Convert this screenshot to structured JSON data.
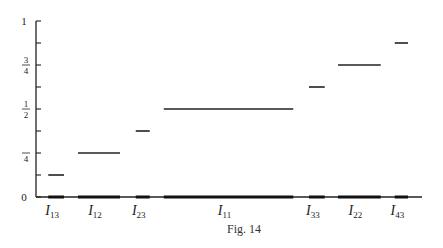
{
  "chart_data": {
    "type": "step-segments",
    "title": "",
    "caption": "Fig. 14",
    "xlabel": "",
    "ylabel": "",
    "ylim": [
      0,
      1
    ],
    "grid": false,
    "y_ticks": [
      0,
      0.125,
      0.25,
      0.375,
      0.5,
      0.625,
      0.75,
      0.875,
      1
    ],
    "y_tick_labels": [
      {
        "value": 0,
        "label": "0"
      },
      {
        "value": 0.25,
        "num": "",
        "den": "4"
      },
      {
        "value": 0.5,
        "num": "1",
        "den": "2"
      },
      {
        "value": 0.75,
        "num": "3",
        "den": "4"
      },
      {
        "value": 1,
        "label": "1"
      }
    ],
    "segments": [
      {
        "name": "I13",
        "symbol": "I",
        "sub": "13",
        "value": 0.125,
        "x_start": 0.035,
        "x_end": 0.08
      },
      {
        "name": "I12",
        "symbol": "I",
        "sub": "12",
        "value": 0.25,
        "x_start": 0.12,
        "x_end": 0.24
      },
      {
        "name": "I23",
        "symbol": "I",
        "sub": "23",
        "value": 0.375,
        "x_start": 0.285,
        "x_end": 0.325
      },
      {
        "name": "I11",
        "symbol": "I",
        "sub": "11",
        "value": 0.5,
        "x_start": 0.365,
        "x_end": 0.735
      },
      {
        "name": "I33",
        "symbol": "I",
        "sub": "33",
        "value": 0.625,
        "x_start": 0.78,
        "x_end": 0.825
      },
      {
        "name": "I22",
        "symbol": "I",
        "sub": "22",
        "value": 0.75,
        "x_start": 0.863,
        "x_end": 0.985
      },
      {
        "name": "I43",
        "symbol": "I",
        "sub": "43",
        "value": 0.875,
        "x_start": 1.025,
        "x_end": 1.063
      }
    ]
  }
}
